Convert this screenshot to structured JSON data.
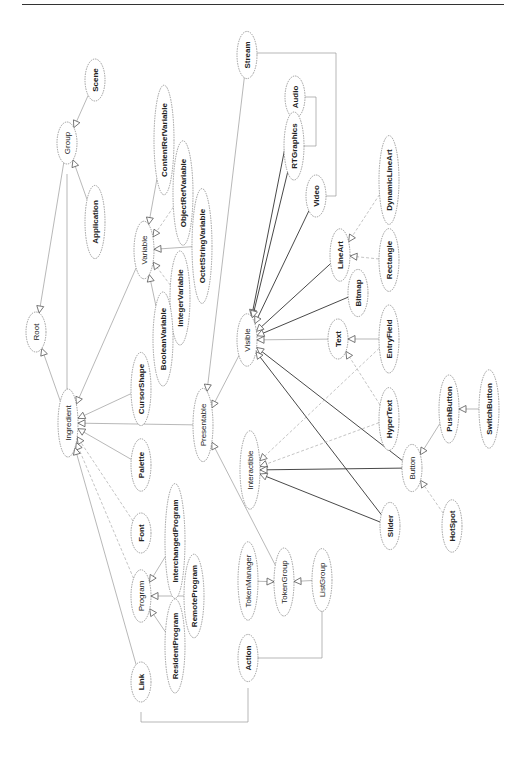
{
  "diagram": {
    "type": "class-hierarchy",
    "orientation": "rotated-90-ccw",
    "nodes": [
      {
        "id": "Root",
        "label": "Root",
        "x": 36,
        "y": 332,
        "bold": false
      },
      {
        "id": "Group",
        "label": "Group",
        "x": 67,
        "y": 143,
        "bold": false
      },
      {
        "id": "Scene",
        "label": "Scene",
        "x": 95,
        "y": 80,
        "bold": true
      },
      {
        "id": "Application",
        "label": "Application",
        "x": 95,
        "y": 222,
        "bold": true
      },
      {
        "id": "Ingredient",
        "label": "Ingredient",
        "x": 68,
        "y": 423,
        "bold": false
      },
      {
        "id": "Variable",
        "label": "Variable",
        "x": 144,
        "y": 250,
        "bold": false
      },
      {
        "id": "ContentRefVariable",
        "label": "ContentRefVariable",
        "x": 164,
        "y": 140,
        "bold": true
      },
      {
        "id": "ObjectRefVariable",
        "label": "ObjectRefVariable",
        "x": 183,
        "y": 193,
        "bold": true
      },
      {
        "id": "OctetStringVariable",
        "label": "OctetStringVariable",
        "x": 202,
        "y": 246,
        "bold": true
      },
      {
        "id": "IntegerVariable",
        "label": "IntegerVariable",
        "x": 180,
        "y": 298,
        "bold": true
      },
      {
        "id": "BooleanVariable",
        "label": "BooleanVariable",
        "x": 163,
        "y": 339,
        "bold": true
      },
      {
        "id": "CursorShape",
        "label": "CursorShape",
        "x": 141,
        "y": 389,
        "bold": true
      },
      {
        "id": "Palette",
        "label": "Palette",
        "x": 141,
        "y": 465,
        "bold": true
      },
      {
        "id": "Font",
        "label": "Font",
        "x": 141,
        "y": 533,
        "bold": true
      },
      {
        "id": "Program",
        "label": "Program",
        "x": 141,
        "y": 596,
        "bold": false
      },
      {
        "id": "InterchangedProgram",
        "label": "InterchangedProgram",
        "x": 175,
        "y": 541,
        "bold": true
      },
      {
        "id": "RemoteProgram",
        "label": "RemoteProgram",
        "x": 194,
        "y": 596,
        "bold": true
      },
      {
        "id": "ResidentProgram",
        "label": "ResidentProgram",
        "x": 175,
        "y": 646,
        "bold": true
      },
      {
        "id": "Link",
        "label": "Link",
        "x": 141,
        "y": 682,
        "bold": true
      },
      {
        "id": "Action",
        "label": "Action",
        "x": 248,
        "y": 658,
        "bold": true
      },
      {
        "id": "TokenManager",
        "label": "TokenManager",
        "x": 248,
        "y": 581,
        "bold": false
      },
      {
        "id": "TokenGroup",
        "label": "TokenGroup",
        "x": 284,
        "y": 582,
        "bold": false
      },
      {
        "id": "ListGroup",
        "label": "ListGroup",
        "x": 322,
        "y": 580,
        "bold": false
      },
      {
        "id": "Presentable",
        "label": "Presentable",
        "x": 203,
        "y": 425,
        "bold": false
      },
      {
        "id": "Stream",
        "label": "Stream",
        "x": 247,
        "y": 55,
        "bold": true
      },
      {
        "id": "Audio",
        "label": "Audio",
        "x": 295,
        "y": 97,
        "bold": true
      },
      {
        "id": "RTGraphics",
        "label": "RTGraphics",
        "x": 294,
        "y": 146,
        "bold": true
      },
      {
        "id": "Video",
        "label": "Video",
        "x": 316,
        "y": 196,
        "bold": true
      },
      {
        "id": "LineArt",
        "label": "LineArt",
        "x": 340,
        "y": 255,
        "bold": true
      },
      {
        "id": "DynamicLineArt",
        "label": "DynamicLineArt",
        "x": 389,
        "y": 180,
        "bold": true
      },
      {
        "id": "Rectangle",
        "label": "Rectangle",
        "x": 389,
        "y": 260,
        "bold": true
      },
      {
        "id": "Bitmap",
        "label": "Bitmap",
        "x": 358,
        "y": 293,
        "bold": true
      },
      {
        "id": "Visible",
        "label": "Visible",
        "x": 247,
        "y": 340,
        "bold": false
      },
      {
        "id": "Text",
        "label": "Text",
        "x": 338,
        "y": 339,
        "bold": true
      },
      {
        "id": "EntryField",
        "label": "EntryField",
        "x": 389,
        "y": 339,
        "bold": true
      },
      {
        "id": "HyperText",
        "label": "HyperText",
        "x": 389,
        "y": 419,
        "bold": true
      },
      {
        "id": "Interactible",
        "label": "Interactible",
        "x": 250,
        "y": 470,
        "bold": false
      },
      {
        "id": "Button",
        "label": "Button",
        "x": 412,
        "y": 468,
        "bold": false
      },
      {
        "id": "PushButton",
        "label": "PushButton",
        "x": 449,
        "y": 409,
        "bold": true
      },
      {
        "id": "SwitchButton",
        "label": "SwitchButton",
        "x": 489,
        "y": 409,
        "bold": true
      },
      {
        "id": "Slider",
        "label": "Slider",
        "x": 390,
        "y": 526,
        "bold": true
      },
      {
        "id": "HotSpot",
        "label": "HotSpot",
        "x": 452,
        "y": 526,
        "bold": true
      }
    ],
    "edges": [
      {
        "from": "Group",
        "to": "Root",
        "style": "light"
      },
      {
        "from": "Ingredient",
        "to": "Root",
        "style": "light"
      },
      {
        "from": "Scene",
        "to": "Group",
        "style": "light"
      },
      {
        "from": "Application",
        "to": "Group",
        "style": "light"
      },
      {
        "from": "Variable",
        "to": "Ingredient",
        "style": "light"
      },
      {
        "from": "CursorShape",
        "to": "Ingredient",
        "style": "light"
      },
      {
        "from": "Palette",
        "to": "Ingredient",
        "style": "light"
      },
      {
        "from": "Font",
        "to": "Ingredient",
        "style": "dash"
      },
      {
        "from": "Program",
        "to": "Ingredient",
        "style": "dash"
      },
      {
        "from": "Link",
        "to": "Ingredient",
        "style": "light"
      },
      {
        "from": "Presentable",
        "to": "Ingredient",
        "style": "light"
      },
      {
        "from": "ContentRefVariable",
        "to": "Variable",
        "style": "light"
      },
      {
        "from": "ObjectRefVariable",
        "to": "Variable",
        "style": "dash"
      },
      {
        "from": "OctetStringVariable",
        "to": "Variable",
        "style": "light"
      },
      {
        "from": "IntegerVariable",
        "to": "Variable",
        "style": "dash"
      },
      {
        "from": "BooleanVariable",
        "to": "Variable",
        "style": "light"
      },
      {
        "from": "InterchangedProgram",
        "to": "Program",
        "style": "light"
      },
      {
        "from": "RemoteProgram",
        "to": "Program",
        "style": "light"
      },
      {
        "from": "ResidentProgram",
        "to": "Program",
        "style": "light"
      },
      {
        "from": "Stream",
        "to": "Presentable",
        "style": "light"
      },
      {
        "from": "Visible",
        "to": "Presentable",
        "style": "light"
      },
      {
        "from": "TokenGroup",
        "to": "Presentable",
        "style": "light"
      },
      {
        "from": "Audio",
        "to": "Visible",
        "style": "dark"
      },
      {
        "from": "RTGraphics",
        "to": "Visible",
        "style": "dark"
      },
      {
        "from": "Video",
        "to": "Visible",
        "style": "dark"
      },
      {
        "from": "LineArt",
        "to": "Visible",
        "style": "dark"
      },
      {
        "from": "Bitmap",
        "to": "Visible",
        "style": "dark"
      },
      {
        "from": "Text",
        "to": "Visible",
        "style": "light"
      },
      {
        "from": "Button",
        "to": "Visible",
        "style": "dark"
      },
      {
        "from": "Slider",
        "to": "Visible",
        "style": "dark"
      },
      {
        "from": "DynamicLineArt",
        "to": "LineArt",
        "style": "dash"
      },
      {
        "from": "Rectangle",
        "to": "LineArt",
        "style": "dash"
      },
      {
        "from": "EntryField",
        "to": "Text",
        "style": "light"
      },
      {
        "from": "HyperText",
        "to": "Text",
        "style": "dash"
      },
      {
        "from": "EntryField",
        "to": "Interactible",
        "style": "dash"
      },
      {
        "from": "HyperText",
        "to": "Interactible",
        "style": "dash"
      },
      {
        "from": "Button",
        "to": "Interactible",
        "style": "dark"
      },
      {
        "from": "Slider",
        "to": "Interactible",
        "style": "dark"
      },
      {
        "from": "PushButton",
        "to": "Button",
        "style": "light"
      },
      {
        "from": "HotSpot",
        "to": "Button",
        "style": "dash"
      },
      {
        "from": "SwitchButton",
        "to": "PushButton",
        "style": "light"
      },
      {
        "from": "ListGroup",
        "to": "TokenGroup",
        "style": "light"
      },
      {
        "from": "TokenManager",
        "to": "TokenGroup",
        "style": "light"
      }
    ],
    "aggregations": [
      {
        "label": "Group-Ingredient",
        "points": [
          [
            67,
            174
          ],
          [
            67,
            392
          ]
        ],
        "dot": [
          67,
          392
        ]
      },
      {
        "label": "Stream-Audio-RTGraphics-Video",
        "points": [
          [
            252,
            53
          ],
          [
            336,
            53
          ],
          [
            336,
            196
          ],
          [
            322,
            196
          ]
        ]
      },
      {
        "label": "Action-TokenGroup-ListGroup",
        "points": [
          [
            254,
            658
          ],
          [
            284,
            658
          ],
          [
            322,
            658
          ],
          [
            322,
            611
          ]
        ]
      },
      {
        "label": "Link-Action",
        "points": [
          [
            141,
            712
          ],
          [
            141,
            722
          ],
          [
            248,
            722
          ],
          [
            248,
            688
          ]
        ]
      }
    ]
  }
}
